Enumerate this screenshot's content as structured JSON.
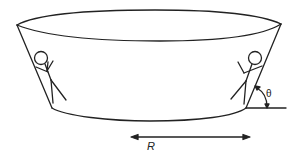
{
  "diagram": {
    "type": "physics-diagram",
    "labels": {
      "radius": "R",
      "angle": "θ"
    },
    "figures": [
      {
        "name": "left-rider",
        "position": "left inner wall"
      },
      {
        "name": "right-rider",
        "position": "right inner wall"
      }
    ],
    "colors": {
      "stroke": "#222222",
      "background": "#ffffff"
    }
  }
}
